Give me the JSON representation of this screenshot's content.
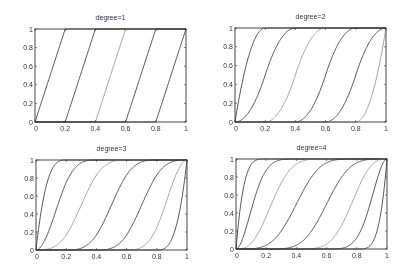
{
  "chart_data": [
    {
      "type": "line",
      "title": "degree=1",
      "degree": 1,
      "breakpoints": [
        0,
        0.2,
        0.4,
        0.6,
        0.8,
        1
      ],
      "xlim": [
        0,
        1
      ],
      "ylim": [
        0,
        1
      ],
      "xticks": [
        "0",
        "0.2",
        "0.4",
        "0.6",
        "0.8",
        "1"
      ],
      "yticks": [
        "0",
        "0.2",
        "0.4",
        "0.6",
        "0.8",
        "1"
      ],
      "xlabel": "",
      "ylabel": "",
      "grid": false,
      "legend": null,
      "series": [
        {
          "name": "curve1",
          "x": [
            0,
            0.2
          ],
          "y": [
            0,
            1
          ]
        },
        {
          "name": "curve2",
          "x": [
            0.2,
            0.4
          ],
          "y": [
            0,
            1
          ]
        },
        {
          "name": "curve3",
          "x": [
            0.4,
            0.6
          ],
          "y": [
            0,
            1
          ]
        },
        {
          "name": "curve4",
          "x": [
            0.6,
            0.8
          ],
          "y": [
            0,
            1
          ]
        },
        {
          "name": "curve5",
          "x": [
            0.8,
            1.0
          ],
          "y": [
            0,
            1
          ]
        }
      ]
    },
    {
      "type": "line",
      "title": "degree=2",
      "degree": 2,
      "breakpoints": [
        0,
        0.2,
        0.4,
        0.6,
        0.8,
        1
      ],
      "xlim": [
        0,
        1
      ],
      "ylim": [
        0,
        1
      ],
      "xticks": [
        "0",
        "0.2",
        "0.4",
        "0.6",
        "0.8",
        "1"
      ],
      "yticks": [
        "0",
        "0.2",
        "0.4",
        "0.6",
        "0.8",
        "1"
      ],
      "xlabel": "",
      "ylabel": "",
      "grid": false,
      "legend": null,
      "series_note": "cumulative B-spline basis functions; each rises 0→1 over its support",
      "series": [
        {
          "name": "curve1",
          "x_start": 0.0,
          "x_end": 0.2
        },
        {
          "name": "curve2",
          "x_start": 0.0,
          "x_end": 0.4
        },
        {
          "name": "curve3",
          "x_start": 0.2,
          "x_end": 0.6
        },
        {
          "name": "curve4",
          "x_start": 0.4,
          "x_end": 0.8
        },
        {
          "name": "curve5",
          "x_start": 0.6,
          "x_end": 1.0
        },
        {
          "name": "curve6",
          "x_start": 0.8,
          "x_end": 1.0
        }
      ]
    },
    {
      "type": "line",
      "title": "degree=3",
      "degree": 3,
      "breakpoints": [
        0,
        0.2,
        0.4,
        0.6,
        0.8,
        1
      ],
      "xlim": [
        0,
        1
      ],
      "ylim": [
        0,
        1
      ],
      "xticks": [
        "0",
        "0.2",
        "0.4",
        "0.6",
        "0.8",
        "1"
      ],
      "yticks": [
        "0",
        "0.2",
        "0.4",
        "0.6",
        "0.8",
        "1"
      ],
      "xlabel": "",
      "ylabel": "",
      "grid": false,
      "legend": null,
      "series": [
        {
          "name": "curve1",
          "x_start": 0.0,
          "x_end": 0.2
        },
        {
          "name": "curve2",
          "x_start": 0.0,
          "x_end": 0.4
        },
        {
          "name": "curve3",
          "x_start": 0.0,
          "x_end": 0.6
        },
        {
          "name": "curve4",
          "x_start": 0.2,
          "x_end": 0.8
        },
        {
          "name": "curve5",
          "x_start": 0.4,
          "x_end": 1.0
        },
        {
          "name": "curve6",
          "x_start": 0.6,
          "x_end": 1.0
        },
        {
          "name": "curve7",
          "x_start": 0.8,
          "x_end": 1.0
        }
      ]
    },
    {
      "type": "line",
      "title": "degree=4",
      "degree": 4,
      "breakpoints": [
        0,
        0.2,
        0.4,
        0.6,
        0.8,
        1
      ],
      "xlim": [
        0,
        1
      ],
      "ylim": [
        0,
        1
      ],
      "xticks": [
        "0",
        "0.2",
        "0.4",
        "0.6",
        "0.8",
        "1"
      ],
      "yticks": [
        "0",
        "0.2",
        "0.4",
        "0.6",
        "0.8",
        "1"
      ],
      "xlabel": "",
      "ylabel": "",
      "grid": false,
      "legend": null,
      "series": [
        {
          "name": "curve1",
          "x_start": 0.0,
          "x_end": 0.2
        },
        {
          "name": "curve2",
          "x_start": 0.0,
          "x_end": 0.4
        },
        {
          "name": "curve3",
          "x_start": 0.0,
          "x_end": 0.6
        },
        {
          "name": "curve4",
          "x_start": 0.0,
          "x_end": 0.8
        },
        {
          "name": "curve5",
          "x_start": 0.2,
          "x_end": 1.0
        },
        {
          "name": "curve6",
          "x_start": 0.4,
          "x_end": 1.0
        },
        {
          "name": "curve7",
          "x_start": 0.6,
          "x_end": 1.0
        },
        {
          "name": "curve8",
          "x_start": 0.8,
          "x_end": 1.0
        }
      ]
    }
  ],
  "layout": {
    "panels": [
      {
        "left": 35,
        "top": 29,
        "width": 151,
        "height": 93,
        "title_y": 14
      },
      {
        "left": 235,
        "top": 28,
        "width": 151,
        "height": 94,
        "title_y": 13
      },
      {
        "left": 36,
        "top": 160,
        "width": 151,
        "height": 90,
        "title_y": 145
      },
      {
        "left": 236,
        "top": 159,
        "width": 151,
        "height": 90,
        "title_y": 144
      }
    ]
  },
  "colors": {
    "axes": "#333333",
    "curve_dark": "#444444",
    "curve_light": "#9a9a9a"
  }
}
